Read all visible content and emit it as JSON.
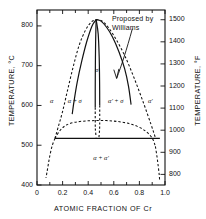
{
  "figure": {
    "kind": "binary-phase-diagram",
    "annotation": {
      "line1": "Proposed by",
      "line2": "Williams"
    }
  },
  "axes": {
    "x": {
      "label": "ATOMIC FRACTION OF Cr",
      "ticks": [
        "0",
        "0.2",
        "0.4",
        "0.6",
        "0.8",
        "1.0"
      ],
      "tick_values": [
        0,
        0.2,
        0.4,
        0.6,
        0.8,
        1.0
      ],
      "min": 0,
      "max": 1.0
    },
    "y_left": {
      "label": "TEMPERATURE, °C",
      "ticks": [
        "400",
        "500",
        "600",
        "700",
        "800"
      ],
      "tick_values": [
        400,
        500,
        600,
        700,
        800
      ],
      "min": 400,
      "max": 840
    },
    "y_right": {
      "label": "TEMPERATURE, °F",
      "ticks": [
        "800",
        "900",
        "1000",
        "1100",
        "1200",
        "1300",
        "1400",
        "1500"
      ],
      "tick_values": [
        800,
        900,
        1000,
        1100,
        1200,
        1300,
        1400,
        1500
      ],
      "min": 752,
      "max": 1544
    }
  },
  "regions": [
    {
      "id": "alpha",
      "label": "α",
      "x": 0.115,
      "t": 612
    },
    {
      "id": "alpha-sigma",
      "label": "α + σ",
      "x": 0.295,
      "t": 612
    },
    {
      "id": "alphap-sigma",
      "label": "α' + σ",
      "x": 0.615,
      "t": 612
    },
    {
      "id": "alpha-prime",
      "label": "α'",
      "x": 0.885,
      "t": 612
    },
    {
      "id": "sigma",
      "label": "σ",
      "x": 0.468,
      "t": 690
    },
    {
      "id": "alpha-alphap",
      "label": "α + α'",
      "x": 0.5,
      "t": 468
    }
  ],
  "chart_data": {
    "type": "line",
    "title": "",
    "xlabel": "ATOMIC FRACTION OF Cr",
    "ylabel": "TEMPERATURE, °C",
    "xlim": [
      0,
      1.0
    ],
    "ylim": [
      400,
      840
    ],
    "grid": false,
    "legend": "none",
    "annotations": [
      {
        "text": "Proposed by Williams",
        "x": 0.66,
        "t": 800,
        "points_to": {
          "x": 0.6,
          "t": 690
        }
      }
    ],
    "series": [
      {
        "name": "sigma-dome-left (solvus alpha/alpha+sigma, dashed upper)",
        "style": "dashed",
        "points": [
          [
            0.14,
            517
          ],
          [
            0.165,
            545
          ],
          [
            0.2,
            585
          ],
          [
            0.24,
            640
          ],
          [
            0.285,
            700
          ],
          [
            0.33,
            752
          ],
          [
            0.38,
            790
          ],
          [
            0.425,
            810
          ],
          [
            0.462,
            816
          ]
        ]
      },
      {
        "name": "sigma-dome-right (solvus alpha'/alpha'+sigma, dashed upper)",
        "style": "dashed",
        "points": [
          [
            0.462,
            816
          ],
          [
            0.51,
            812
          ],
          [
            0.56,
            795
          ],
          [
            0.62,
            765
          ],
          [
            0.69,
            722
          ],
          [
            0.76,
            668
          ],
          [
            0.83,
            608
          ],
          [
            0.89,
            553
          ],
          [
            0.925,
            519
          ]
        ]
      },
      {
        "name": "alpha-solvus-solid-left",
        "style": "solid",
        "points": [
          [
            0.462,
            816
          ],
          [
            0.43,
            800
          ],
          [
            0.39,
            762
          ],
          [
            0.35,
            712
          ],
          [
            0.315,
            660
          ],
          [
            0.29,
            612
          ],
          [
            0.275,
            578
          ]
        ]
      },
      {
        "name": "alpha-prime-solvus-solid-right",
        "style": "solid",
        "points": [
          [
            0.462,
            816
          ],
          [
            0.5,
            812
          ],
          [
            0.545,
            796
          ],
          [
            0.59,
            772
          ],
          [
            0.64,
            735
          ],
          [
            0.685,
            692
          ],
          [
            0.715,
            648
          ],
          [
            0.735,
            602
          ]
        ]
      },
      {
        "name": "sigma-band-left-boundary",
        "style": "solid-then-dashed",
        "points": [
          [
            0.462,
            816
          ],
          [
            0.458,
            760
          ],
          [
            0.456,
            700
          ],
          [
            0.455,
            640
          ],
          [
            0.455,
            595
          ],
          [
            0.455,
            565
          ],
          [
            0.456,
            540
          ],
          [
            0.462,
            520
          ]
        ]
      },
      {
        "name": "sigma-band-right-boundary",
        "style": "solid-then-dashed",
        "points": [
          [
            0.462,
            816
          ],
          [
            0.478,
            780
          ],
          [
            0.486,
            720
          ],
          [
            0.489,
            660
          ],
          [
            0.49,
            600
          ],
          [
            0.49,
            565
          ],
          [
            0.489,
            540
          ],
          [
            0.484,
            520
          ]
        ]
      },
      {
        "name": "miscibility-gap-dashed",
        "style": "dashed",
        "points": [
          [
            0.14,
            517
          ],
          [
            0.18,
            537
          ],
          [
            0.23,
            551
          ],
          [
            0.3,
            558
          ],
          [
            0.38,
            561
          ],
          [
            0.46,
            562
          ],
          [
            0.54,
            562
          ],
          [
            0.62,
            560
          ],
          [
            0.7,
            556
          ],
          [
            0.78,
            548
          ],
          [
            0.85,
            535
          ],
          [
            0.9,
            518
          ],
          [
            0.925,
            497
          ]
        ]
      },
      {
        "name": "alpha-low-temp-boundary-dashed-left",
        "style": "dashed",
        "points": [
          [
            0.14,
            517
          ],
          [
            0.12,
            500
          ],
          [
            0.103,
            478
          ],
          [
            0.09,
            455
          ],
          [
            0.078,
            432
          ],
          [
            0.07,
            418
          ]
        ]
      },
      {
        "name": "alpha-prime-low-temp-boundary-dashed-right",
        "style": "dashed",
        "points": [
          [
            0.925,
            497
          ],
          [
            0.938,
            470
          ],
          [
            0.948,
            445
          ],
          [
            0.955,
            425
          ],
          [
            0.958,
            412
          ]
        ]
      },
      {
        "name": "invariant-horizontal-solid",
        "style": "solid",
        "points": [
          [
            0.14,
            517
          ],
          [
            0.96,
            517
          ]
        ]
      }
    ]
  }
}
